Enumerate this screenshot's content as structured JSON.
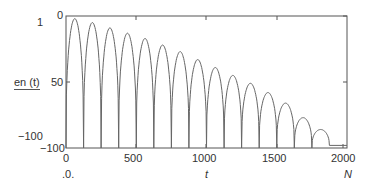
{
  "chart_data": {
    "type": "line",
    "title": "",
    "xlabel": "t",
    "ylabel": "en (t)",
    "x_end_label": "N",
    "x_origin_label": ".0.",
    "side_labels": {
      "top": "1",
      "bottom": "-100"
    },
    "xlim": [
      0,
      2000
    ],
    "ylim": [
      -100,
      0
    ],
    "x_ticks": [
      0,
      500,
      1000,
      1500,
      2000
    ],
    "y_ticks": [
      0,
      -50,
      -100
    ],
    "y_tick_labels": [
      "0",
      "50",
      "-100"
    ],
    "grid": false,
    "legend": null,
    "arch_period": 125,
    "series": [
      {
        "name": "en(t)",
        "arch_starts": [
          0,
          125,
          250,
          375,
          500,
          625,
          750,
          875,
          1000,
          1125,
          1250,
          1375,
          1500,
          1625,
          1750
        ],
        "arch_peaks": [
          -2,
          -5,
          -9,
          -13,
          -17,
          -22,
          -27,
          -33,
          -39,
          -45,
          -51,
          -58,
          -66,
          -77,
          -86
        ],
        "floor_value": -100,
        "tail_value": -98
      }
    ]
  },
  "labels": {
    "top_left": "1",
    "ylabel": "en (t)",
    "bottom_left": "−100",
    "y0": "0",
    "y50": "50",
    "y100": "−100",
    "x0": "0",
    "x500": "500",
    "x1000": "1000",
    "x1500": "1500",
    "x2000": "2000",
    "origin": ".0.",
    "xlabel": "t",
    "xend": "N"
  }
}
